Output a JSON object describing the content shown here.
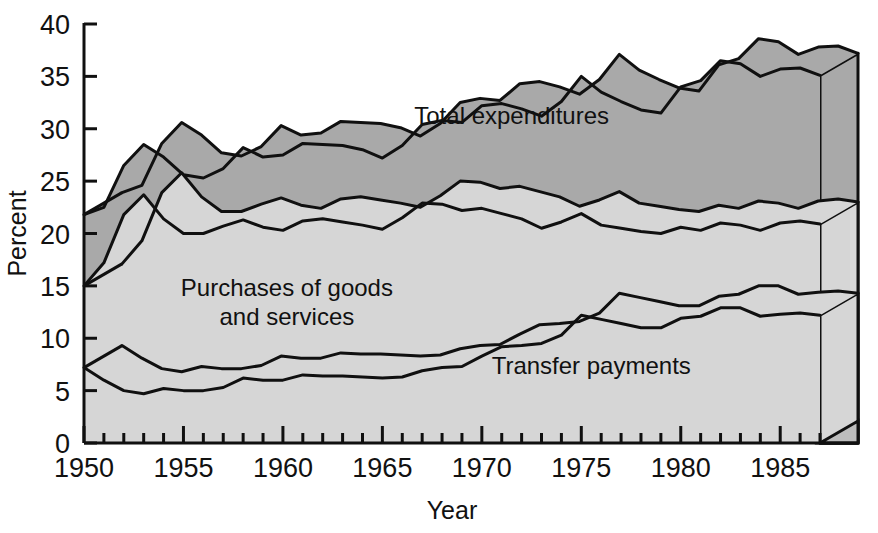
{
  "chart_data": {
    "type": "area",
    "style": "3d-stacked-ribbon",
    "title": "",
    "xlabel": "Year",
    "ylabel": "Percent",
    "xlim": [
      1950,
      1987
    ],
    "ylim": [
      0,
      40
    ],
    "ytick_values": [
      0,
      5,
      10,
      15,
      20,
      25,
      30,
      35,
      40
    ],
    "ytick_labels": [
      "0",
      "5",
      "10",
      "15",
      "20",
      "25",
      "30",
      "35",
      "40"
    ],
    "xtick_major_values": [
      1950,
      1955,
      1960,
      1965,
      1970,
      1975,
      1980,
      1985
    ],
    "xtick_major_labels": [
      "1950",
      "1955",
      "1960",
      "1965",
      "1970",
      "1975",
      "1980",
      "1985"
    ],
    "xtick_minor_step": 1,
    "grid": false,
    "legend_position": "inline-annotations",
    "x": [
      1950,
      1951,
      1952,
      1953,
      1954,
      1955,
      1956,
      1957,
      1958,
      1959,
      1960,
      1961,
      1962,
      1963,
      1964,
      1965,
      1966,
      1967,
      1968,
      1969,
      1970,
      1971,
      1972,
      1973,
      1974,
      1975,
      1976,
      1977,
      1978,
      1979,
      1980,
      1981,
      1982,
      1983,
      1984,
      1985,
      1986,
      1987
    ],
    "series": [
      {
        "name": "Total expenditures",
        "label": "Total expenditures",
        "label_x": 1971.5,
        "label_y": 30.5,
        "fill": "#a9a9a9",
        "values": [
          21.8,
          22.5,
          26.5,
          28.5,
          27.3,
          25.6,
          25.3,
          26.2,
          28.2,
          27.3,
          27.5,
          28.6,
          28.5,
          28.4,
          28.0,
          27.2,
          28.4,
          30.4,
          30.8,
          30.6,
          32.2,
          32.4,
          31.9,
          31.2,
          32.6,
          35.0,
          33.5,
          32.6,
          31.8,
          31.5,
          34.0,
          34.6,
          36.5,
          36.2,
          35.0,
          35.7,
          35.8,
          35.1
        ]
      },
      {
        "name": "Purchases of goods and services",
        "label_line1": "Purchases of goods",
        "label_line2": "and services",
        "label_x": 1960.2,
        "label_y": 14.0,
        "fill": "#d6d6d6",
        "values": [
          15.0,
          17.2,
          21.8,
          23.7,
          21.4,
          20.0,
          20.0,
          20.7,
          21.3,
          20.6,
          20.3,
          21.2,
          21.4,
          21.1,
          20.8,
          20.4,
          21.5,
          22.9,
          22.8,
          22.2,
          22.4,
          21.9,
          21.4,
          20.5,
          21.1,
          21.9,
          20.8,
          20.5,
          20.2,
          20.0,
          20.6,
          20.3,
          21.0,
          20.8,
          20.3,
          21.0,
          21.2,
          20.9
        ]
      },
      {
        "name": "Transfer payments",
        "label": "Transfer payments",
        "label_x": 1975.5,
        "label_y": 6.6,
        "fill": "#d6d6d6",
        "values": [
          7.2,
          6.0,
          5.0,
          4.7,
          5.2,
          5.0,
          5.0,
          5.3,
          6.2,
          6.0,
          6.0,
          6.5,
          6.4,
          6.4,
          6.3,
          6.2,
          6.3,
          6.9,
          7.2,
          7.3,
          8.3,
          9.2,
          9.3,
          9.5,
          10.3,
          12.2,
          11.8,
          11.4,
          11.0,
          11.0,
          11.9,
          12.1,
          12.9,
          12.9,
          12.1,
          12.3,
          12.4,
          12.2
        ]
      }
    ]
  },
  "axes": {
    "y_title": "Percent",
    "x_title": "Year"
  }
}
